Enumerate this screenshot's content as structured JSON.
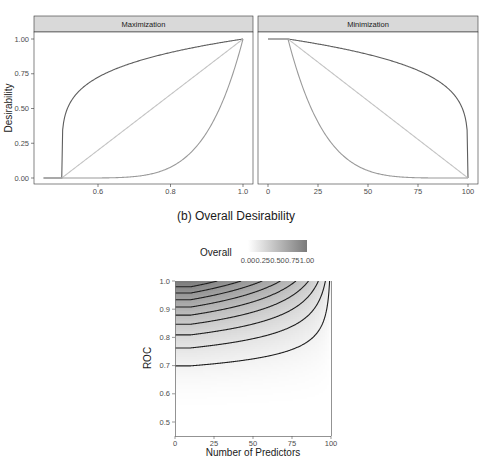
{
  "figure": {
    "subtitle_b": "(b) Overall Desirability"
  },
  "chart_data": [
    {
      "type": "line",
      "title": "Maximization",
      "xlabel": "",
      "ylabel": "Desirability",
      "xlim": [
        0.45,
        1.0
      ],
      "ylim": [
        0,
        1
      ],
      "x_ticks": [
        "0.6",
        "0.8",
        "1.0"
      ],
      "y_ticks": [
        "0.00",
        "0.25",
        "0.50",
        "0.75",
        "1.00"
      ],
      "function": "d = ((x - 0.5) / 0.5)^s for 0.5 <= x <= 1, 0 for x < 0.5",
      "low": 0.5,
      "high": 1.0,
      "series": [
        {
          "name": "scale 0.2",
          "scale": 0.2,
          "color": "#5e5e5e"
        },
        {
          "name": "scale 1",
          "scale": 1,
          "color": "#c4c4c4"
        },
        {
          "name": "scale 5",
          "scale": 5,
          "color": "#9a9a9a"
        }
      ],
      "sample_points": {
        "x": [
          0.45,
          0.5,
          0.6,
          0.7,
          0.8,
          0.9,
          1.0
        ],
        "scale_0.2": [
          0,
          0,
          0.72,
          0.83,
          0.9,
          0.96,
          1.0
        ],
        "scale_1": [
          0,
          0,
          0.2,
          0.4,
          0.6,
          0.8,
          1.0
        ],
        "scale_5": [
          0,
          0,
          0.0003,
          0.01,
          0.08,
          0.33,
          1.0
        ]
      }
    },
    {
      "type": "line",
      "title": "Minimization",
      "xlabel": "",
      "ylabel": "Desirability",
      "xlim": [
        0,
        100
      ],
      "ylim": [
        0,
        1
      ],
      "x_ticks": [
        "0",
        "25",
        "50",
        "75",
        "100"
      ],
      "function": "d = ((100 - x) / 90)^s for 10 <= x <= 100, 1 for x < 10",
      "low": 10,
      "high": 100,
      "series": [
        {
          "name": "scale 0.2",
          "scale": 0.2,
          "color": "#5e5e5e"
        },
        {
          "name": "scale 1",
          "scale": 1,
          "color": "#c4c4c4"
        },
        {
          "name": "scale 5",
          "scale": 5,
          "color": "#9a9a9a"
        }
      ],
      "sample_points": {
        "x": [
          0,
          10,
          25,
          50,
          75,
          100
        ],
        "scale_0.2": [
          1,
          1,
          0.96,
          0.89,
          0.76,
          0
        ],
        "scale_1": [
          1,
          1,
          0.83,
          0.56,
          0.28,
          0
        ],
        "scale_5": [
          1,
          1,
          0.4,
          0.05,
          0.002,
          0
        ]
      }
    },
    {
      "type": "heatmap",
      "title": "(b) Overall Desirability",
      "xlabel": "Number of Predictors",
      "ylabel": "ROC",
      "xlim": [
        0,
        100
      ],
      "ylim": [
        0.45,
        1.0
      ],
      "x_ticks": [
        "0",
        "25",
        "50",
        "75",
        "100"
      ],
      "y_ticks": [
        "0.5",
        "0.6",
        "0.7",
        "0.8",
        "0.9",
        "1.0"
      ],
      "legend": {
        "title": "Overall",
        "ticks": [
          "0.00",
          "0.25",
          "0.50",
          "0.75",
          "1.00"
        ],
        "position": "top",
        "color_low": "#ffffff",
        "color_high": "#7a7a7a"
      },
      "function": "overall = sqrt(dROC * dPred); dROC = ((ROC-0.5)/0.5)^5; dPred = (100-x)/90 clipped to [0,1]",
      "roc_scale": 5,
      "pred_low": 10,
      "pred_high": 100,
      "contour_levels": [
        0.1,
        0.2,
        0.3,
        0.4,
        0.5,
        0.6,
        0.7,
        0.8,
        0.9
      ],
      "contour_roc_at_x0": [
        0.7,
        0.76,
        0.81,
        0.85,
        0.88,
        0.91,
        0.93,
        0.96,
        0.98
      ],
      "line_color": "#1f1f1f"
    }
  ]
}
